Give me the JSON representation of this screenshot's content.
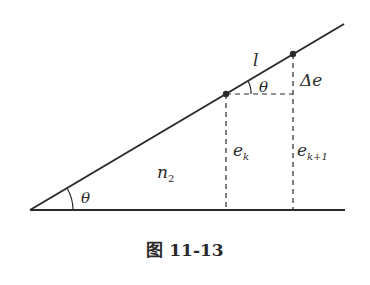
{
  "diagram": {
    "labels": {
      "segment": "l",
      "theta_top": "θ",
      "delta_e": "Δe",
      "e_k_main": "e",
      "e_k_sub": "k",
      "e_k1_main": "e",
      "e_k1_sub": "k+1",
      "n2_main": "n",
      "n2_sub": "2",
      "theta_bottom": "θ"
    },
    "caption": "图 11-13",
    "colors": {
      "stroke": "#2a2a2a",
      "background": "#ffffff"
    }
  }
}
